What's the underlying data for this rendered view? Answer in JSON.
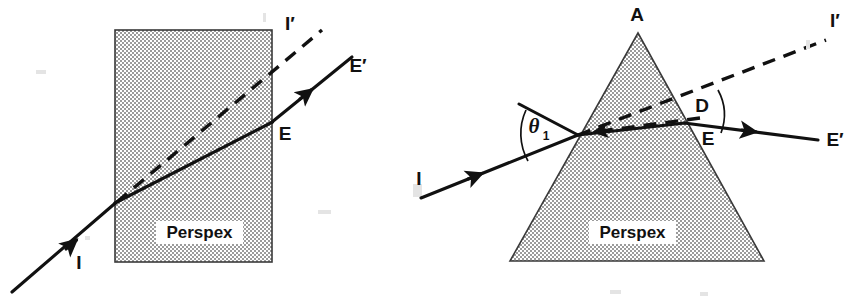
{
  "figure": {
    "background_color": "#ffffff",
    "ink_color": "#111111",
    "block_fill_color": "#c8c8c8",
    "block_outline_color": "#3a3a3a"
  },
  "left_diagram": {
    "name": "rectangular-block-refraction",
    "shape": "rectangle",
    "material_label": "Perspex",
    "labels": {
      "incident_ray": "I",
      "incident_extension": "I′",
      "exit_point": "E",
      "emergent_ray": "E′"
    },
    "geometry": {
      "block": {
        "x": 115,
        "y": 30,
        "width": 157,
        "height": 232
      },
      "incident_ray": {
        "from": [
          12,
          292
        ],
        "to": [
          115,
          203
        ]
      },
      "internal_ray": {
        "from": [
          115,
          203
        ],
        "to": [
          272,
          122
        ]
      },
      "emergent_ray": {
        "from": [
          272,
          122
        ],
        "to": [
          352,
          58
        ]
      },
      "dashed_extension": {
        "from": [
          115,
          203
        ],
        "to": [
          322,
          30
        ]
      }
    }
  },
  "right_diagram": {
    "name": "prism-refraction",
    "shape": "triangular-prism",
    "material_label": "Perspex",
    "labels": {
      "apex": "A",
      "incident_ray": "I",
      "incidence_angle": "θ",
      "incidence_angle_subscript": "1",
      "deviation_angle": "D",
      "exit_point": "E",
      "emergent_ray": "E′",
      "incident_extension": "I′"
    },
    "geometry": {
      "prism": {
        "apex": [
          638,
          33
        ],
        "base_left": [
          510,
          261
        ],
        "base_right": [
          764,
          261
        ]
      },
      "incident_ray": {
        "from": [
          421,
          198
        ],
        "to": [
          578,
          135
        ]
      },
      "internal_ray": {
        "from": [
          578,
          135
        ],
        "to": [
          684,
          123
        ]
      },
      "emergent_ray": {
        "from": [
          684,
          123
        ],
        "to": [
          818,
          140
        ]
      },
      "dashed_extension": {
        "from": [
          578,
          135
        ],
        "to": [
          826,
          40
        ]
      },
      "normal_guide": {
        "from": [
          520,
          105
        ],
        "to": [
          578,
          135
        ]
      }
    }
  }
}
